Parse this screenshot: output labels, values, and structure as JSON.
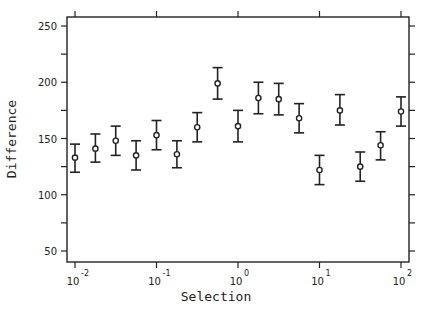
{
  "chart_data": {
    "type": "scatter",
    "title": "",
    "xlabel": "Selection",
    "ylabel": "Difference",
    "xscale": "log",
    "xlim": [
      0.01,
      100
    ],
    "ylim": [
      40,
      258
    ],
    "grid": false,
    "legend": null,
    "x_ticks": [
      {
        "value": 0.01,
        "base": "10",
        "exp": "-2"
      },
      {
        "value": 0.1,
        "base": "10",
        "exp": "-1"
      },
      {
        "value": 1,
        "base": "10",
        "exp": "0"
      },
      {
        "value": 10,
        "base": "10",
        "exp": "1"
      },
      {
        "value": 100,
        "base": "10",
        "exp": "2"
      }
    ],
    "y_ticks": [
      50,
      100,
      150,
      200,
      250
    ],
    "y_minor_ticks": [
      75,
      125,
      175,
      225
    ],
    "series": [
      {
        "name": "Difference",
        "marker": "circle",
        "error_bars": true,
        "points": [
          {
            "x": 0.01,
            "y": 133,
            "err_low": 120,
            "err_high": 145
          },
          {
            "x": 0.0178,
            "y": 141,
            "err_low": 129,
            "err_high": 154
          },
          {
            "x": 0.0316,
            "y": 148,
            "err_low": 135,
            "err_high": 161
          },
          {
            "x": 0.0562,
            "y": 135,
            "err_low": 122,
            "err_high": 148
          },
          {
            "x": 0.1,
            "y": 153,
            "err_low": 140,
            "err_high": 166
          },
          {
            "x": 0.178,
            "y": 136,
            "err_low": 124,
            "err_high": 148
          },
          {
            "x": 0.316,
            "y": 160,
            "err_low": 147,
            "err_high": 173
          },
          {
            "x": 0.562,
            "y": 199,
            "err_low": 185,
            "err_high": 213
          },
          {
            "x": 1,
            "y": 161,
            "err_low": 147,
            "err_high": 175
          },
          {
            "x": 1.78,
            "y": 186,
            "err_low": 172,
            "err_high": 200
          },
          {
            "x": 3.16,
            "y": 185,
            "err_low": 171,
            "err_high": 199
          },
          {
            "x": 5.62,
            "y": 168,
            "err_low": 155,
            "err_high": 181
          },
          {
            "x": 10,
            "y": 122,
            "err_low": 109,
            "err_high": 135
          },
          {
            "x": 17.8,
            "y": 175,
            "err_low": 162,
            "err_high": 189
          },
          {
            "x": 31.6,
            "y": 125,
            "err_low": 112,
            "err_high": 138
          },
          {
            "x": 56.2,
            "y": 144,
            "err_low": 131,
            "err_high": 156
          },
          {
            "x": 100,
            "y": 174,
            "err_low": 161,
            "err_high": 187
          }
        ]
      }
    ]
  },
  "colors": {
    "ink": "#222222",
    "background": "#ffffff"
  }
}
